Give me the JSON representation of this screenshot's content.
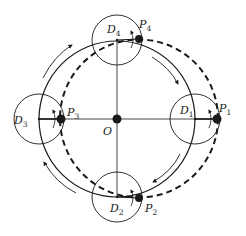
{
  "diagram": {
    "title": "",
    "center_label": "O",
    "colors": {
      "ink": "#1a1a1a",
      "background": "#ffffff"
    },
    "geometry": {
      "center": [
        117,
        119
      ],
      "outer_circle_radius": 78,
      "dashed_circle_center": [
        139,
        118.5
      ],
      "dashed_circle_radius": 79,
      "small_circle_radius": 25
    },
    "small_circles": [
      {
        "id": "D1",
        "label": "D",
        "sub": "1",
        "cx": 195,
        "cy": 119
      },
      {
        "id": "D2",
        "label": "D",
        "sub": "2",
        "cx": 117,
        "cy": 197
      },
      {
        "id": "D3",
        "label": "D",
        "sub": "3",
        "cx": 39,
        "cy": 119
      },
      {
        "id": "D4",
        "label": "D",
        "sub": "4",
        "cx": 117,
        "cy": 40
      }
    ],
    "points": [
      {
        "id": "P1",
        "label": "P",
        "sub": "1",
        "x": 217,
        "y": 119
      },
      {
        "id": "P2",
        "label": "P",
        "sub": "2",
        "x": 139,
        "y": 198
      },
      {
        "id": "P3",
        "label": "P",
        "sub": "3",
        "x": 61,
        "y": 119
      },
      {
        "id": "P4",
        "label": "P",
        "sub": "4",
        "x": 139,
        "y": 39
      }
    ],
    "labels": {
      "O": "O",
      "D1": "D",
      "D1_sub": "1",
      "D2": "D",
      "D2_sub": "2",
      "D3": "D",
      "D3_sub": "3",
      "D4": "D",
      "D4_sub": "4",
      "P1": "P",
      "P1_sub": "1",
      "P2": "P",
      "P2_sub": "2",
      "P3": "P",
      "P3_sub": "3",
      "P4": "P",
      "P4_sub": "4"
    },
    "rotation_direction": "clockwise"
  }
}
